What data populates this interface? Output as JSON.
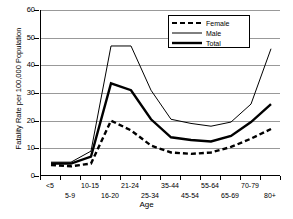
{
  "chart_data": {
    "type": "line",
    "title": "",
    "xlabel": "Age",
    "ylabel": "Fatality Rate per 100,000 Population",
    "categories": [
      "<5",
      "5-9",
      "10-15",
      "16-20",
      "21-24",
      "25-34",
      "35-44",
      "45-54",
      "55-64",
      "65-69",
      "70-79",
      "80+"
    ],
    "ylim": [
      0,
      60
    ],
    "yticks": [
      0,
      10,
      20,
      30,
      40,
      50,
      60
    ],
    "grid": "horizontal",
    "legend_position": "top-right",
    "series": [
      {
        "name": "Female",
        "style": "dashed-bold",
        "values": [
          4,
          3.5,
          4.5,
          20,
          16.5,
          11,
          8.5,
          8,
          8.5,
          10.5,
          13.5,
          17
        ]
      },
      {
        "name": "Male",
        "style": "thin-solid",
        "values": [
          5,
          5,
          9,
          47,
          47,
          31,
          20.5,
          19,
          18,
          19.5,
          26,
          46
        ]
      },
      {
        "name": "Total",
        "style": "thick-solid",
        "values": [
          4.5,
          4.5,
          7,
          33.5,
          31,
          20.5,
          14,
          13,
          12.5,
          14.5,
          19.5,
          26
        ]
      }
    ]
  },
  "legend": {
    "items": [
      {
        "label": "Female"
      },
      {
        "label": "Male"
      },
      {
        "label": "Total"
      }
    ]
  },
  "colors": {
    "axis": "#000000",
    "grid": "#999999",
    "series": "#000000",
    "background": "#ffffff"
  }
}
